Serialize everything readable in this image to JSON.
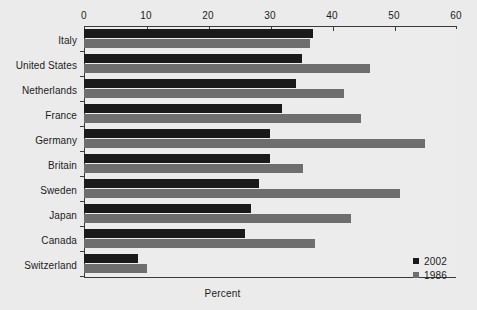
{
  "chart_data": {
    "type": "bar",
    "orientation": "horizontal",
    "title": "",
    "xlabel": "Percent",
    "ylabel": "",
    "xlim": [
      0,
      60
    ],
    "xticks": [
      0,
      10,
      20,
      30,
      40,
      50,
      60
    ],
    "grid": false,
    "legend_position": "bottom-right",
    "categories": [
      "Italy",
      "United States",
      "Netherlands",
      "France",
      "Germany",
      "Britain",
      "Sweden",
      "Japan",
      "Canada",
      "Switzerland"
    ],
    "series": [
      {
        "name": "2002",
        "color": "#1a1a1a",
        "values": [
          37.0,
          35.2,
          34.2,
          32.0,
          30.0,
          30.0,
          28.2,
          27.0,
          26.0,
          8.7
        ]
      },
      {
        "name": "1986",
        "color": "#6e6e6e",
        "values": [
          36.4,
          46.1,
          42.0,
          44.7,
          55.0,
          35.3,
          51.0,
          43.0,
          37.2,
          10.2
        ]
      }
    ]
  },
  "legend": {
    "items": [
      {
        "label": "2002",
        "swatch": "dark-swatch-icon"
      },
      {
        "label": "1986",
        "swatch": "gray-swatch-icon"
      }
    ]
  },
  "colors": {
    "background": "#ebebeb",
    "plot_background": "#ececec",
    "axis": "#3a3a3a",
    "series_2002": "#1a1a1a",
    "series_1986": "#6e6e6e",
    "text": "#1b1b1b"
  }
}
